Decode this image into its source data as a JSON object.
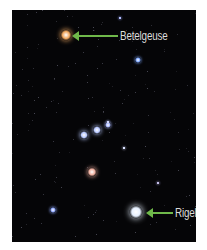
{
  "image": {
    "subject": "Orion constellation star field",
    "background_color": "#050507",
    "frame_color": "#ffffff",
    "arrow_color": "#6fb84a",
    "label_color": "#dcdcdc"
  },
  "labels": [
    {
      "text": "Betelgeuse",
      "target": "Betelgeuse"
    },
    {
      "text": "Rigel",
      "target": "Rigel"
    }
  ],
  "stars": [
    {
      "name": "Betelgeuse",
      "x": 66,
      "y": 35,
      "size": 11,
      "color": "#f0a860"
    },
    {
      "name": "Rigel",
      "x": 136,
      "y": 212,
      "size": 13,
      "color": "#e6f0ff"
    },
    {
      "name": "Bellatrix",
      "x": 138,
      "y": 60,
      "size": 6,
      "color": "#7fa8ff"
    },
    {
      "name": "Meissa",
      "x": 120,
      "y": 18,
      "size": 3,
      "color": "#9aa8ff"
    },
    {
      "name": "Alnitak",
      "x": 84,
      "y": 135,
      "size": 8,
      "color": "#b8c8ff"
    },
    {
      "name": "Alnilam",
      "x": 97,
      "y": 130,
      "size": 8,
      "color": "#b8c8ff"
    },
    {
      "name": "Mintaka",
      "x": 108,
      "y": 125,
      "size": 6,
      "color": "#a8b8ff"
    },
    {
      "name": "Orion Nebula",
      "x": 92,
      "y": 172,
      "size": 9,
      "color": "#f0b0a0"
    },
    {
      "name": "Saiph-side star",
      "x": 53,
      "y": 210,
      "size": 6,
      "color": "#8fa8ff"
    },
    {
      "name": "Sword star",
      "x": 124,
      "y": 148,
      "size": 3,
      "color": "#d0d8ff"
    },
    {
      "name": "Right star",
      "x": 158,
      "y": 183,
      "size": 3,
      "color": "#b0a8e0"
    },
    {
      "name": "Mid star",
      "x": 108,
      "y": 122,
      "size": 3,
      "color": "#c0c8ff"
    }
  ]
}
